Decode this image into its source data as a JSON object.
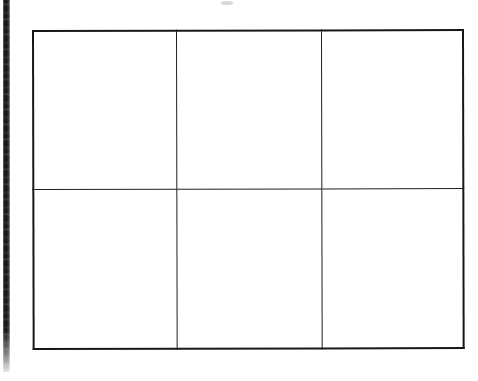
{
  "page": {
    "kind": "scanned-document",
    "background_color": "#ffffff",
    "width": 478,
    "height": 381
  },
  "artifacts": {
    "left_edge_band": {
      "name": "scan-edge-shadow",
      "color": "#0d0d0d",
      "visible": true
    },
    "top_speck": {
      "name": "scan-speck",
      "color": "#b9b9b9",
      "visible": true
    }
  },
  "table": {
    "name": "empty-grid-table",
    "rows": 2,
    "columns": 3,
    "border_color": "#171717",
    "grid_line_color": "#1f1f1f",
    "cell_fill": "#ffffff",
    "has_header": false,
    "caption": "",
    "column_headers": [
      "",
      "",
      ""
    ],
    "cells": [
      [
        "",
        "",
        ""
      ],
      [
        "",
        "",
        ""
      ]
    ]
  }
}
